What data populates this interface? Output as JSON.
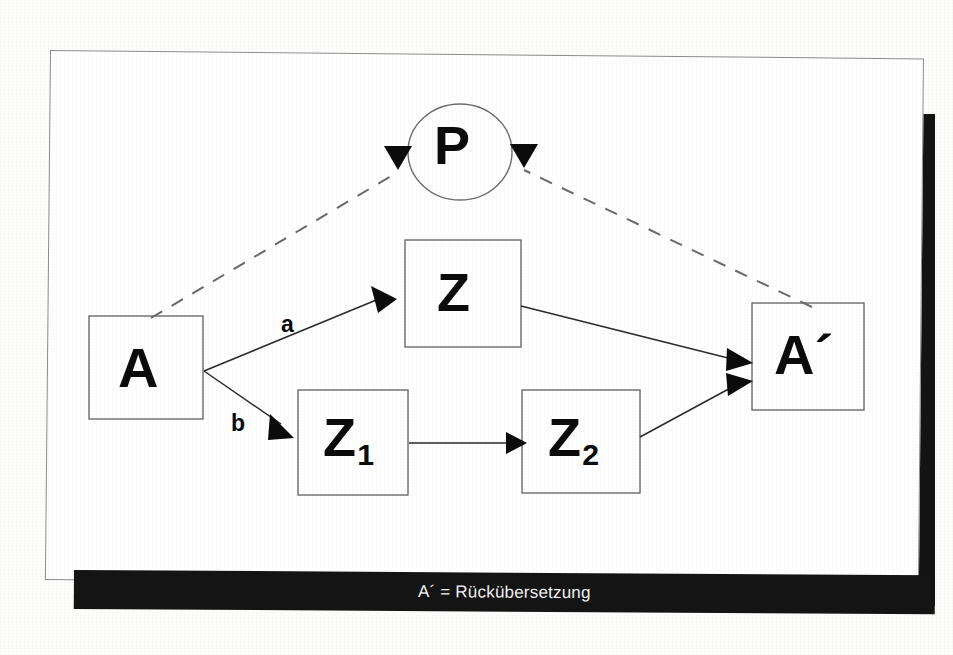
{
  "figure": {
    "caption": "A´ = Rückübersetzung",
    "background_color": "#fdfdfc",
    "page_color": "#ffffff",
    "shadow_color": "#131313",
    "ink_color": "#0b0b0b"
  },
  "diagram": {
    "type": "flow-diagram",
    "nodes": [
      {
        "id": "P",
        "label": "P",
        "shape": "ellipse",
        "cx": 460,
        "cy": 152,
        "rx": 52,
        "ry": 48
      },
      {
        "id": "A",
        "label": "A",
        "shape": "rect",
        "x": 89,
        "y": 316,
        "w": 114,
        "h": 103
      },
      {
        "id": "Z",
        "label": "Z",
        "shape": "rect",
        "x": 405,
        "y": 240,
        "w": 116,
        "h": 107
      },
      {
        "id": "Z1",
        "label": "Z",
        "sub": "1",
        "shape": "rect",
        "x": 298,
        "y": 390,
        "w": 110,
        "h": 105
      },
      {
        "id": "Z2",
        "label": "Z",
        "sub": "2",
        "shape": "rect",
        "x": 522,
        "y": 390,
        "w": 118,
        "h": 103
      },
      {
        "id": "Astrich",
        "label": "A´",
        "shape": "rect",
        "x": 752,
        "y": 303,
        "w": 112,
        "h": 107
      }
    ],
    "edges": [
      {
        "from": "A",
        "to": "Z",
        "label": "a",
        "style": "solid"
      },
      {
        "from": "A",
        "to": "Z1",
        "label": "b",
        "style": "solid"
      },
      {
        "from": "Z1",
        "to": "Z2",
        "label": "",
        "style": "solid"
      },
      {
        "from": "Z",
        "to": "Astrich",
        "label": "",
        "style": "solid"
      },
      {
        "from": "Z2",
        "to": "Astrich",
        "label": "",
        "style": "solid"
      },
      {
        "from": "A",
        "to": "P",
        "label": "",
        "style": "dashed"
      },
      {
        "from": "Astrich",
        "to": "P",
        "label": "",
        "style": "dashed"
      }
    ],
    "edge_labels": {
      "a": "a",
      "b": "b"
    }
  }
}
